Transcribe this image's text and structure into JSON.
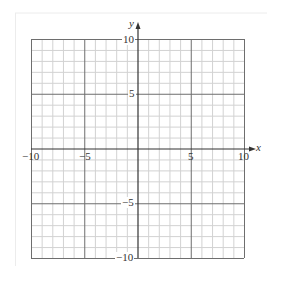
{
  "chart_data": {
    "type": "scatter",
    "title": "",
    "xlabel": "x",
    "ylabel": "y",
    "xlim": [
      -10,
      10
    ],
    "ylim": [
      -10,
      10
    ],
    "grid": true,
    "grid_minor_step": 1,
    "grid_major_step": 5,
    "x_ticks": [
      -10,
      -5,
      5,
      10
    ],
    "y_ticks": [
      10,
      5,
      -5,
      -10
    ],
    "x_tick_labels": [
      "−10",
      "−5",
      "5",
      "10"
    ],
    "y_tick_labels": [
      "10",
      "5",
      "−5",
      "−10"
    ],
    "series": [],
    "legend": null
  },
  "colors": {
    "minor_grid": "#d2d2d2",
    "major_grid": "#6e6e6e",
    "axis": "#333333",
    "frame": "#ececec"
  }
}
